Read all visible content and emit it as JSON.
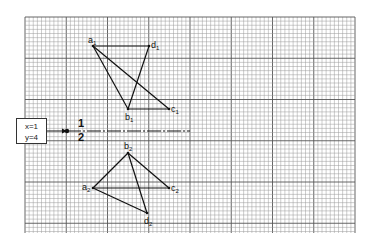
{
  "diagram": {
    "grid": {
      "left": 25,
      "top": 17,
      "right": 355,
      "bottom": 233,
      "minor_step": 4.125,
      "major_every": 10,
      "minor_color": "#9a9a9a",
      "major_color": "#555555"
    },
    "coord_box": {
      "x_label": "x=1",
      "y_label": "y=4"
    },
    "divider": {
      "label_top": "1",
      "label_bottom": "2"
    },
    "figure_1": {
      "vertices": {
        "a": {
          "label": "a",
          "sub": "1",
          "x": 93,
          "y": 46
        },
        "d": {
          "label": "d",
          "sub": "1",
          "x": 149,
          "y": 46
        },
        "b": {
          "label": "b",
          "sub": "1",
          "x": 128,
          "y": 109
        },
        "c": {
          "label": "c",
          "sub": "1",
          "x": 169,
          "y": 109
        }
      },
      "edges": [
        [
          "a",
          "d"
        ],
        [
          "a",
          "b"
        ],
        [
          "a",
          "c"
        ],
        [
          "d",
          "b"
        ],
        [
          "b",
          "c"
        ]
      ]
    },
    "figure_2": {
      "vertices": {
        "b": {
          "label": "b",
          "sub": "2",
          "x": 128,
          "y": 153
        },
        "a": {
          "label": "a",
          "sub": "2",
          "x": 93,
          "y": 188
        },
        "c": {
          "label": "c",
          "sub": "2",
          "x": 169,
          "y": 188
        },
        "d": {
          "label": "d",
          "sub": "2",
          "x": 147,
          "y": 213
        }
      },
      "edges": [
        [
          "b",
          "a"
        ],
        [
          "b",
          "c"
        ],
        [
          "b",
          "d"
        ],
        [
          "a",
          "c"
        ],
        [
          "a",
          "d"
        ]
      ]
    }
  }
}
